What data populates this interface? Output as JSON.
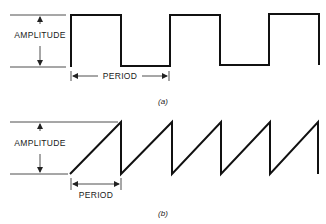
{
  "figure_a": {
    "type": "square-wave",
    "amplitude_label": "AMPLITUDE",
    "period_label": "PERIOD",
    "caption": "(a)"
  },
  "figure_b": {
    "type": "sawtooth-wave",
    "amplitude_label": "AMPLITUDE",
    "period_label": "PERIOD",
    "caption": "(b)"
  },
  "colors": {
    "stroke": "#111111",
    "background": "#ffffff"
  }
}
